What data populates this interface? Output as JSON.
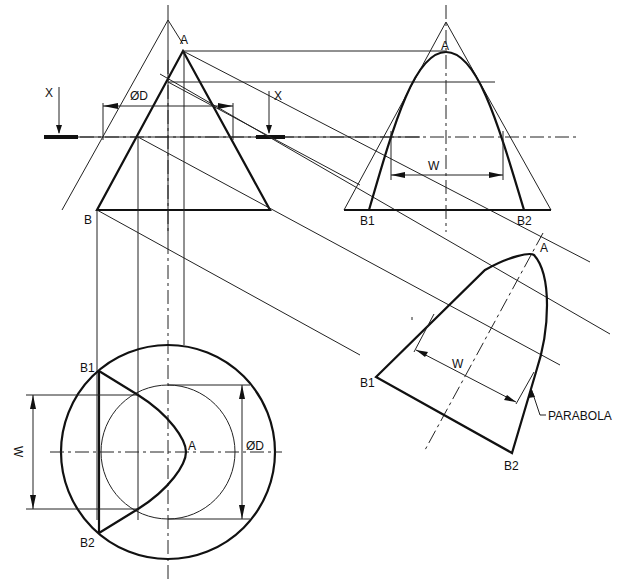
{
  "figure": {
    "type": "engineering-drawing",
    "colors": {
      "line": "#111111",
      "background": "#ffffff"
    }
  },
  "views": {
    "elevation": {
      "apex_label": "A",
      "base_label": "B",
      "diameter_label": "ØD",
      "cut_plane_labels": [
        "X",
        "X"
      ]
    },
    "end_view": {
      "apex_label": "A",
      "base_labels": [
        "B1",
        "B2"
      ],
      "width_label": "W"
    },
    "plan": {
      "apex_label": "A",
      "base_labels": [
        "B1",
        "B2"
      ],
      "width_label": "W",
      "diameter_label": "ØD"
    },
    "true_shape": {
      "apex_label": "A",
      "base_labels": [
        "B1",
        "B2"
      ],
      "width_label": "W",
      "curve_label": "PARABOLA"
    }
  }
}
